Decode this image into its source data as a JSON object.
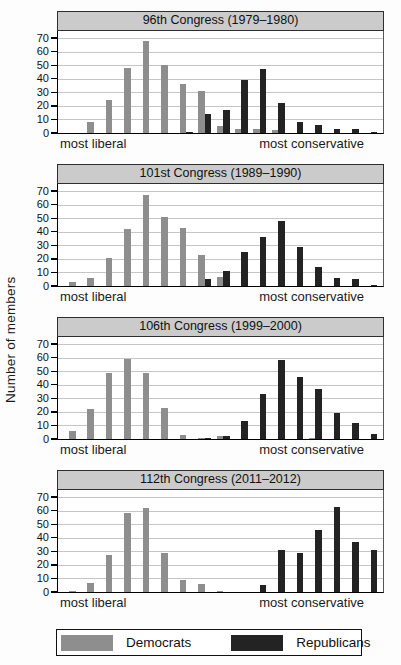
{
  "figure_title": "Ideological distribution of members of Congress over time",
  "chart_data": {
    "type": "bar",
    "ylabel": "Number of members",
    "yticks": [
      0,
      10,
      20,
      30,
      40,
      50,
      60,
      70
    ],
    "ylim": [
      0,
      76
    ],
    "units_per_tick": 10,
    "grid": "horizontal",
    "x_left_label": "most liberal",
    "x_right_label": "most conservative",
    "legend_position": "bottom",
    "legend": [
      {
        "label": "Democrats",
        "color": "#8e8e8e"
      },
      {
        "label": "Republicans",
        "color": "#232323"
      }
    ],
    "panels": [
      {
        "title": "96th Congress (1979–1980)",
        "bins": [
          {
            "d": 0,
            "r": 0
          },
          {
            "d": 8,
            "r": 0
          },
          {
            "d": 24,
            "r": 0
          },
          {
            "d": 48,
            "r": 0
          },
          {
            "d": 68,
            "r": 0
          },
          {
            "d": 50,
            "r": 0
          },
          {
            "d": 36,
            "r": 1
          },
          {
            "d": 31,
            "r": 14
          },
          {
            "d": 5,
            "r": 17
          },
          {
            "d": 3,
            "r": 39
          },
          {
            "d": 3,
            "r": 47
          },
          {
            "d": 2,
            "r": 22
          },
          {
            "d": 0,
            "r": 8
          },
          {
            "d": 0,
            "r": 6
          },
          {
            "d": 0,
            "r": 3
          },
          {
            "d": 0,
            "r": 3
          },
          {
            "d": 0,
            "r": 1
          }
        ]
      },
      {
        "title": "101st Congress (1989–1990)",
        "bins": [
          {
            "d": 3,
            "r": 0
          },
          {
            "d": 6,
            "r": 0
          },
          {
            "d": 21,
            "r": 0
          },
          {
            "d": 42,
            "r": 0
          },
          {
            "d": 67,
            "r": 0
          },
          {
            "d": 51,
            "r": 0
          },
          {
            "d": 43,
            "r": 0
          },
          {
            "d": 23,
            "r": 5
          },
          {
            "d": 7,
            "r": 11
          },
          {
            "d": 0,
            "r": 25
          },
          {
            "d": 0,
            "r": 36
          },
          {
            "d": 0,
            "r": 48
          },
          {
            "d": 0,
            "r": 29
          },
          {
            "d": 0,
            "r": 14
          },
          {
            "d": 0,
            "r": 6
          },
          {
            "d": 0,
            "r": 5
          },
          {
            "d": 0,
            "r": 1
          }
        ]
      },
      {
        "title": "106th Congress (1999–2000)",
        "bins": [
          {
            "d": 6,
            "r": 0
          },
          {
            "d": 22,
            "r": 0
          },
          {
            "d": 49,
            "r": 0
          },
          {
            "d": 59,
            "r": 0
          },
          {
            "d": 49,
            "r": 0
          },
          {
            "d": 23,
            "r": 0
          },
          {
            "d": 3,
            "r": 0
          },
          {
            "d": 1,
            "r": 1
          },
          {
            "d": 2,
            "r": 2
          },
          {
            "d": 0,
            "r": 13
          },
          {
            "d": 0,
            "r": 33
          },
          {
            "d": 0,
            "r": 58
          },
          {
            "d": 0,
            "r": 46
          },
          {
            "d": 1,
            "r": 37
          },
          {
            "d": 0,
            "r": 19
          },
          {
            "d": 0,
            "r": 12
          },
          {
            "d": 0,
            "r": 4
          }
        ]
      },
      {
        "title": "112th Congress (2011–2012)",
        "bins": [
          {
            "d": 1,
            "r": 0
          },
          {
            "d": 7,
            "r": 0
          },
          {
            "d": 27,
            "r": 0
          },
          {
            "d": 58,
            "r": 0
          },
          {
            "d": 62,
            "r": 0
          },
          {
            "d": 29,
            "r": 0
          },
          {
            "d": 9,
            "r": 0
          },
          {
            "d": 6,
            "r": 0
          },
          {
            "d": 1,
            "r": 0
          },
          {
            "d": 0,
            "r": 0
          },
          {
            "d": 0,
            "r": 5
          },
          {
            "d": 0,
            "r": 31
          },
          {
            "d": 0,
            "r": 29
          },
          {
            "d": 0,
            "r": 46
          },
          {
            "d": 0,
            "r": 63
          },
          {
            "d": 0,
            "r": 37
          },
          {
            "d": 0,
            "r": 31
          }
        ]
      }
    ]
  }
}
